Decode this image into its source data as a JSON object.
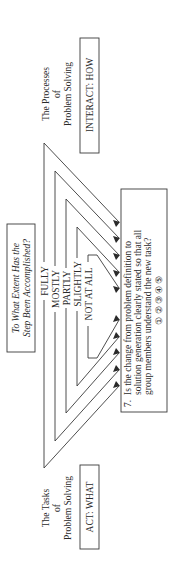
{
  "diagram": {
    "orientation": "rotated-90-ccw",
    "header_box": {
      "line1": "To What Extent Has the",
      "line2": "Step Been Accomplished?"
    },
    "top_label": {
      "line1": "The Processes",
      "line2": "of",
      "line3": "Problem Solving",
      "box": "INTERACT: HOW"
    },
    "bottom_label": {
      "line1": "The Tasks",
      "line2": "of",
      "line3": "Problem Solving",
      "box": "ACT: WHAT"
    },
    "scale": [
      {
        "label": "FULLY"
      },
      {
        "label": "MOSTLY"
      },
      {
        "label": "PARTLY"
      },
      {
        "label": "SLIGHTLY"
      },
      {
        "label": "NOT AT ALL"
      }
    ],
    "question": {
      "number": "7.",
      "line1": "Is the change from problem definition to",
      "line2": "solution generation clearly stated so that all",
      "line3": "group members understand the new task?",
      "ratings": "① ② ③ ④ ⑤"
    },
    "colors": {
      "ink": "#2a2a2a",
      "background": "#ffffff"
    }
  }
}
